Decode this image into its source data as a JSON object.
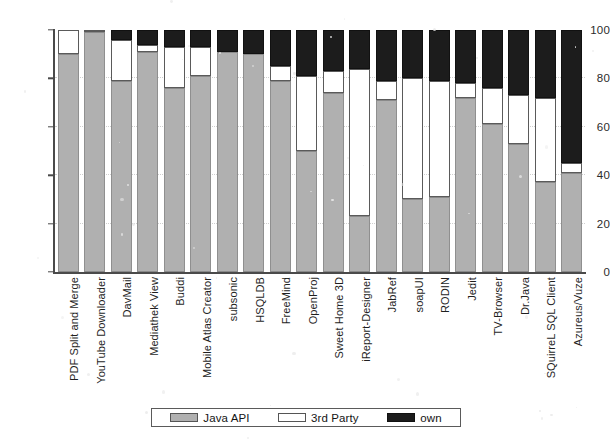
{
  "chart_data": {
    "type": "bar",
    "subtype": "stacked-bar-percent",
    "title": "",
    "xlabel": "",
    "ylabel": "",
    "ylim": [
      0,
      100
    ],
    "yticks": [
      0,
      20,
      40,
      60,
      80,
      100
    ],
    "grid": true,
    "legend_position": "bottom",
    "legend": [
      "Java API",
      "3rd Party",
      "own"
    ],
    "colors": {
      "Java API": "#b0b0b0",
      "3rd Party": "#ffffff",
      "own": "#1c1c1c",
      "axis": "#4a4a4a",
      "grid": "#cfcfcf"
    },
    "categories": [
      "PDF Split and Merge",
      "YouTube Downloader",
      "DavMail",
      "Mediathek View",
      "Buddi",
      "Mobile Atlas Creator",
      "subsonic",
      "HSQLDB",
      "FreeMind",
      "OpenProj",
      "Sweet Home 3D",
      "iReport-Designer",
      "JabRef",
      "soapUI",
      "RODIN",
      "Jedit",
      "TV-Browser",
      "Dr.Java",
      "SQuirreL SQL Client",
      "Azureus/Vuze"
    ],
    "series": [
      {
        "name": "Java API",
        "values": [
          90,
          99,
          79,
          91,
          76,
          81,
          91,
          90,
          79,
          50,
          74,
          23,
          71,
          30,
          31,
          72,
          61,
          53,
          37,
          41
        ]
      },
      {
        "name": "3rd Party",
        "values": [
          10,
          1,
          17,
          3,
          17,
          12,
          0,
          0,
          6,
          31,
          9,
          61,
          8,
          50,
          48,
          6,
          15,
          20,
          35,
          4
        ]
      },
      {
        "name": "own",
        "values": [
          0,
          0,
          4,
          6,
          7,
          7,
          9,
          10,
          15,
          19,
          17,
          16,
          21,
          20,
          21,
          22,
          24,
          27,
          28,
          55
        ]
      }
    ]
  },
  "ytick_labels": [
    "0",
    "20",
    "40",
    "60",
    "80",
    "100"
  ],
  "legend": {
    "items": [
      {
        "label": "Java API",
        "icon": "legend-swatch-gray"
      },
      {
        "label": "3rd Party",
        "icon": "legend-swatch-white"
      },
      {
        "label": "own",
        "icon": "legend-swatch-black"
      }
    ]
  }
}
